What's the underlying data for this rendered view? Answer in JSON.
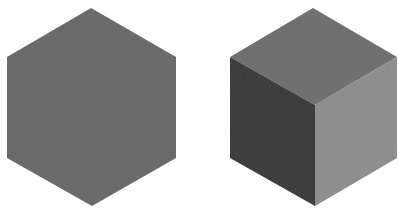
{
  "figures": [
    {
      "name": "flat-hexagon",
      "description": "Uniformly shaded hexagon",
      "fill": "#6b6b6b",
      "points": "91,8 176,57 176,158 92,206 7,158 7,57"
    },
    {
      "name": "shaded-cube",
      "description": "Isometric cube with three shaded faces",
      "faces": {
        "top": {
          "fill": "#707070",
          "points": "313,8 397,57 315,105 230,57"
        },
        "left": {
          "fill": "#3e3e3e",
          "points": "230,57 315,105 315,206 230,158"
        },
        "right": {
          "fill": "#8e8e8e",
          "points": "315,105 397,57 397,158 315,206"
        }
      }
    }
  ]
}
